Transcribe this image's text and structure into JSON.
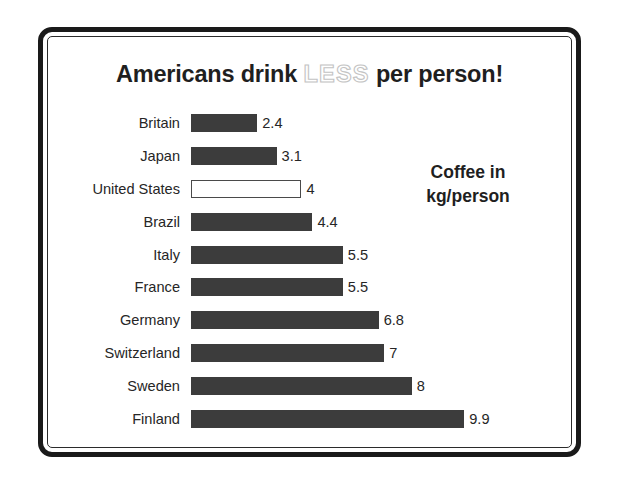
{
  "frame": {
    "border_color": "#1a1a1a",
    "inner_border_color": "#2b2b2b",
    "background": "#ffffff"
  },
  "title": {
    "part1": "Americans drink ",
    "emphasis": "LESS",
    "part2": " per person!",
    "emphasis_style": "outlined"
  },
  "axis_note": {
    "line1": "Coffee in",
    "line2": "kg/person"
  },
  "chart_data": {
    "type": "bar",
    "orientation": "horizontal",
    "title": "Americans drink LESS per person!",
    "xlabel": "Coffee in kg/person",
    "ylabel": "",
    "xlim": [
      0,
      9.9
    ],
    "grid": false,
    "legend": false,
    "bar_color": "#3c3c3c",
    "highlight_color": "#ffffff",
    "highlight_border_color": "#4a4a4a",
    "highlight_category": "United States",
    "categories": [
      "Britain",
      "Japan",
      "United States",
      "Brazil",
      "Italy",
      "France",
      "Germany",
      "Switzerland",
      "Sweden",
      "Finland"
    ],
    "values": [
      2.4,
      3.1,
      4,
      4.4,
      5.5,
      5.5,
      6.8,
      7,
      8,
      9.9
    ],
    "value_labels": [
      "2.4",
      "3.1",
      "4",
      "4.4",
      "5.5",
      "5.5",
      "6.8",
      "7",
      "8",
      "9.9"
    ]
  }
}
